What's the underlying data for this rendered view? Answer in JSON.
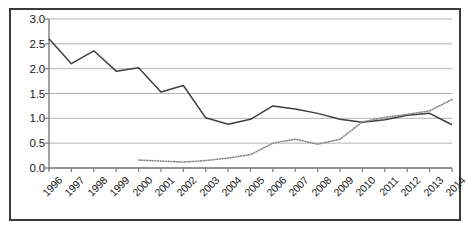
{
  "chart_data": {
    "type": "line",
    "title": "",
    "subtitle": "",
    "xlabel": "",
    "ylabel": "",
    "categories": [
      "1996",
      "1997",
      "1998",
      "1999",
      "2000",
      "2001",
      "2002",
      "2003",
      "2004",
      "2005",
      "2006",
      "2007",
      "2008",
      "2009",
      "2010",
      "2011",
      "2012",
      "2013",
      "2014"
    ],
    "x_tick_labels": [
      "1996",
      "1997",
      "1998",
      "1999",
      "2000",
      "2001",
      "2002",
      "2003",
      "2004",
      "2005",
      "2006",
      "2007",
      "2008",
      "2009",
      "2010",
      "2011",
      "2012",
      "2013",
      "2014"
    ],
    "y_tick_labels": [
      "0.0",
      "0.5",
      "1.0",
      "1.5",
      "2.0",
      "2.5",
      "3.0"
    ],
    "y_tick_values": [
      0.0,
      0.5,
      1.0,
      1.5,
      2.0,
      2.5,
      3.0
    ],
    "ylim": [
      0.0,
      3.0
    ],
    "grid": "horizontal",
    "legend": "none",
    "series": [
      {
        "name": "solid-series",
        "style": "solid",
        "color": "#3f3f3f",
        "values": [
          2.6,
          2.1,
          2.36,
          1.95,
          2.02,
          1.53,
          1.66,
          1.01,
          0.88,
          0.98,
          1.25,
          1.19,
          1.1,
          0.98,
          0.92,
          0.97,
          1.06,
          1.1,
          0.87
        ]
      },
      {
        "name": "dotted-series",
        "style": "dotted",
        "color": "#8a8a8a",
        "values": [
          null,
          null,
          null,
          null,
          0.16,
          0.14,
          0.12,
          0.15,
          0.2,
          0.27,
          0.5,
          0.58,
          0.48,
          0.58,
          0.93,
          1.02,
          1.08,
          1.15,
          1.38
        ]
      }
    ]
  },
  "style": {
    "border_color": "#3a3a3a",
    "grid_color": "#b4b4b4",
    "axis_color": "#7d7d7d",
    "text_color": "#1a1a1a",
    "background": "#ffffff"
  }
}
